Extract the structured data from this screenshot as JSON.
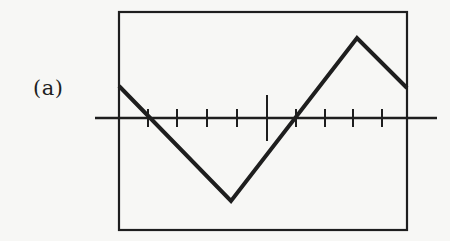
{
  "figure": {
    "panel_label": "(a)",
    "colors": {
      "background": "#f7f7f5",
      "ink": "#1e1e1e"
    },
    "frame": {
      "left": 119,
      "top": 12,
      "right": 407,
      "bottom": 230
    },
    "axis": {
      "y": 118,
      "x_start": 95,
      "x_end": 437,
      "ticks": [
        148,
        177,
        207,
        237,
        267,
        296,
        325,
        353,
        382
      ],
      "long_tick_index": 4,
      "tick_half_len": 9,
      "long_tick_half_len": 23
    },
    "waveform": {
      "points": [
        [
          119,
          86
        ],
        [
          231,
          201
        ],
        [
          357,
          38
        ],
        [
          407,
          88
        ]
      ],
      "stroke_width": 4
    }
  }
}
